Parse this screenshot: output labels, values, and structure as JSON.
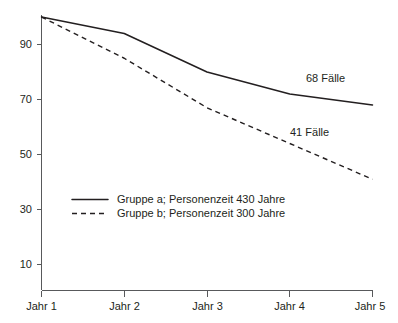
{
  "chart_data": {
    "type": "line",
    "title": "",
    "xlabel": "",
    "ylabel": "",
    "categories": [
      "Jahr 1",
      "Jahr 2",
      "Jahr 3",
      "Jahr 4",
      "Jahr 5"
    ],
    "x_tick_labels": [
      "Jahr 1",
      "Jahr 2",
      "Jahr 3",
      "Jahr 4",
      "Jahr 5"
    ],
    "y_tick_labels": [
      "10",
      "30",
      "50",
      "70",
      "90"
    ],
    "y_ticks": [
      10,
      30,
      50,
      70,
      90
    ],
    "ylim": [
      2,
      100
    ],
    "xlim": [
      1,
      5
    ],
    "grid": false,
    "legend_position": "inside-lower-left",
    "series": [
      {
        "name": "Gruppe a; Personenzeit 430 Jahre",
        "style": "solid",
        "color": "#231f20",
        "values": [
          100,
          94,
          80,
          72,
          68
        ],
        "end_label": "68 Fälle"
      },
      {
        "name": "Gruppe b; Personenzeit 300 Jahre",
        "style": "dashed",
        "color": "#231f20",
        "values": [
          100,
          85,
          67,
          54,
          41
        ],
        "end_label": "41 Fälle"
      }
    ],
    "annotations": [
      {
        "text": "68 Fälle",
        "series": "Gruppe a; Personenzeit 430 Jahre",
        "x": 4.55,
        "y": 75
      },
      {
        "text": "41 Fälle",
        "series": "Gruppe b; Personenzeit 300 Jahre",
        "x": 4.35,
        "y": 57
      }
    ]
  },
  "legend": {
    "entries": [
      {
        "label": "Gruppe a; Personenzeit 430 Jahre",
        "style": "solid"
      },
      {
        "label": "Gruppe b; Personenzeit 300 Jahre",
        "style": "dashed"
      }
    ]
  },
  "axes": {
    "y_labels": [
      "90",
      "70",
      "50",
      "30",
      "10"
    ],
    "x_labels": [
      "Jahr 1",
      "Jahr 2",
      "Jahr 3",
      "Jahr 4",
      "Jahr 5"
    ]
  },
  "colors": {
    "series": "#231f20",
    "axis": "#58595b",
    "text": "#231f20",
    "background": "#ffffff"
  }
}
